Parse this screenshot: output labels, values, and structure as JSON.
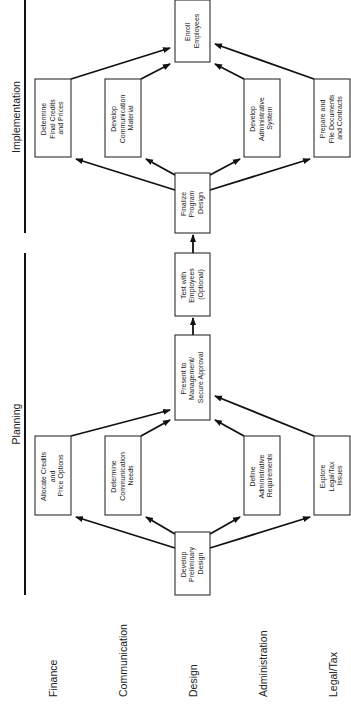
{
  "phases": {
    "implementation": "Implementation",
    "planning": "Planning"
  },
  "rows": [
    "Finance",
    "Communication",
    "Design",
    "Administration",
    "Legal/Tax"
  ],
  "nodes": {
    "develop_preliminary_design": [
      "Develop",
      "Preliminary",
      "Design"
    ],
    "allocate_credits": [
      "Allocate Credits",
      "and",
      "Price Options"
    ],
    "determine_comm_needs": [
      "Determine",
      "Communication",
      "Needs"
    ],
    "define_admin_requirements": [
      "Define",
      "Administrative",
      "Requirements"
    ],
    "explore_legal_tax": [
      "Explore",
      "Legal/Tax",
      "Issues"
    ],
    "present_to_management": [
      "Present to",
      "Management/",
      "Secure Approval"
    ],
    "test_with_employees": [
      "Test with",
      "Employees",
      "(Optional)"
    ],
    "finalize_program_design": [
      "Finalize",
      "Program",
      "Design"
    ],
    "determine_final_credits": [
      "Determine",
      "Final Credits",
      "and Prices"
    ],
    "develop_comm_material": [
      "Develop",
      "Communication",
      "Material"
    ],
    "develop_admin_system": [
      "Develop",
      "Administrative",
      "System"
    ],
    "prepare_file_documents": [
      "Prepare and",
      "File Documents",
      "and Contracts"
    ],
    "enroll_employees": [
      "Enroll",
      "Employees"
    ]
  },
  "colors": {
    "line": "#111111",
    "text": "#222222",
    "background": "#ffffff"
  }
}
